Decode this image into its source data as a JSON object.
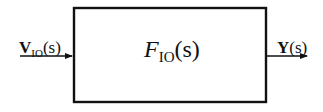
{
  "diagram": {
    "type": "block-diagram",
    "block": {
      "function_symbol": "F",
      "function_subscript": "IO",
      "function_argument": "(s)"
    },
    "input": {
      "symbol": "V",
      "subscript": "IO",
      "argument": "(s)"
    },
    "output": {
      "symbol": "Y",
      "argument": "(s)"
    },
    "colors": {
      "stroke": "#111111",
      "background": "#ffffff"
    }
  }
}
